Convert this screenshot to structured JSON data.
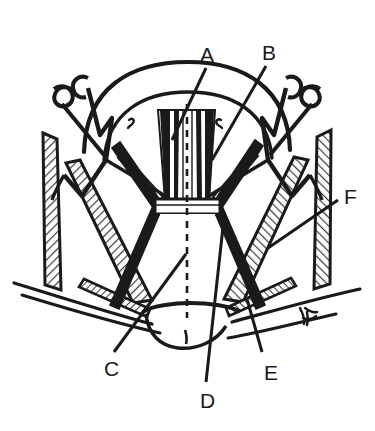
{
  "figure": {
    "background_color": "#ffffff",
    "ink_color": "#1a1a1a",
    "hatch_color": "#4a4a4a",
    "midline_style": "dashed"
  },
  "labels": [
    {
      "id": "A",
      "text": "A",
      "x": 200,
      "y": 44,
      "leader_from": [
        206,
        68
      ],
      "leader_to": [
        172,
        140
      ]
    },
    {
      "id": "B",
      "text": "B",
      "x": 262,
      "y": 42,
      "leader_from": [
        266,
        66
      ],
      "leader_to": [
        212,
        160
      ]
    },
    {
      "id": "C",
      "text": "C",
      "x": 104,
      "y": 358,
      "leader_from": [
        114,
        352
      ],
      "leader_to": [
        186,
        254
      ]
    },
    {
      "id": "D",
      "text": "D",
      "x": 200,
      "y": 390,
      "leader_from": [
        206,
        382
      ],
      "leader_to": [
        223,
        227
      ]
    },
    {
      "id": "E",
      "text": "E",
      "x": 264,
      "y": 362,
      "leader_from": [
        262,
        352
      ],
      "leader_to": [
        247,
        299
      ]
    },
    {
      "id": "F",
      "text": "F",
      "x": 344,
      "y": 186,
      "leader_from": [
        338,
        200
      ],
      "leader_to": [
        268,
        248
      ]
    }
  ],
  "parts": {
    "retractor_left": "left-retractor-hook",
    "retractor_right": "right-retractor-hook",
    "dome_arc_outer": "thyroid-cartilage-outer-arc",
    "dome_arc_inner": "thyroid-cartilage-inner-arc",
    "midline_raphe": "midline-dashed-raphe",
    "central_band": "central-muscle-band",
    "isthmus_block": "isthmus-transverse-block",
    "flap_outer_left": "left-outer-hatched-flap",
    "flap_outer_right": "right-outer-hatched-flap",
    "flap_inner_left": "left-inner-hatched-flap",
    "flap_inner_right": "right-inner-hatched-flap",
    "flap_lower_left": "left-lower-hatched-strap",
    "flap_lower_right": "right-lower-hatched-strap",
    "clavicle_left": "left-clavicle-line",
    "clavicle_right": "right-clavicle-line",
    "sternal_notch": "sternal-notch-outline",
    "vessel_tie": "vessel-tie-squiggle"
  }
}
